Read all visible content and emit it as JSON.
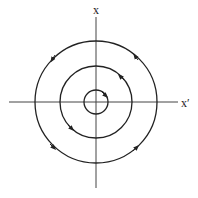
{
  "diagram": {
    "type": "phase-portrait",
    "center": {
      "x": 96,
      "y": 102
    },
    "axes": {
      "vertical_label": "x",
      "horizontal_label": "x′",
      "color": "#333333"
    },
    "orbits": [
      {
        "name": "inner",
        "radius": 12,
        "direction": "clockwise"
      },
      {
        "name": "middle",
        "radius": 36,
        "direction": "counterclockwise"
      },
      {
        "name": "outer",
        "radius": 61,
        "direction": "counterclockwise"
      }
    ],
    "stroke_color": "#222222"
  }
}
